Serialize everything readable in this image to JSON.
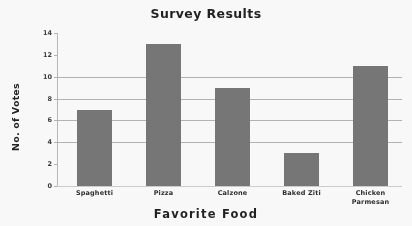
{
  "chart_data": {
    "type": "bar",
    "title": "Survey Results",
    "xlabel": "Favorite Food",
    "ylabel": "No. of Votes",
    "categories": [
      "Spaghetti",
      "Pizza",
      "Calzone",
      "Baked Ziti",
      "Chicken Parmesan"
    ],
    "values": [
      7,
      13,
      9,
      3,
      11
    ],
    "ylim": [
      0,
      14
    ],
    "yticks": [
      0,
      2,
      4,
      6,
      8,
      10,
      12,
      14
    ],
    "ytick_labels": [
      "0",
      "2",
      "4",
      "6",
      "8",
      "10",
      "12",
      "14"
    ],
    "grid": true,
    "gridlines_at": [
      4,
      6,
      8,
      10
    ],
    "legend": null,
    "bar_color": "#767676",
    "axis_color": "#b4b4b4",
    "background": "#ffffff"
  },
  "labels": {
    "cat_0_line_1": "Spaghetti",
    "cat_0_line_2": "",
    "cat_1_line_1": "Pizza",
    "cat_1_line_2": "",
    "cat_2_line_1": "Calzone",
    "cat_2_line_2": "",
    "cat_3_line_1": "Baked Ziti",
    "cat_3_line_2": "",
    "cat_4_line_1": "Chicken",
    "cat_4_line_2": "Parmesan"
  }
}
